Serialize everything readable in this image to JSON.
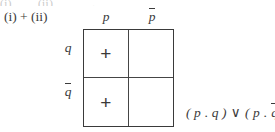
{
  "figure": {
    "case_label": "(i) + (ii)",
    "top_remnant": "(i)        (ii)            .              ,",
    "ink_color": "#3a3a3a",
    "background_color": "#ffffff"
  },
  "grid": {
    "columns": [
      {
        "label_base": "p",
        "overbar": false,
        "icon": "variable-p"
      },
      {
        "label_base": "p",
        "overbar": true,
        "icon": "variable-p-negated"
      }
    ],
    "rows": [
      {
        "label_base": "q",
        "overbar": false,
        "icon": "variable-q"
      },
      {
        "label_base": "q",
        "overbar": true,
        "icon": "variable-q-negated"
      }
    ],
    "cells": [
      [
        {
          "mark": "+",
          "filled": true
        },
        {
          "mark": "",
          "filled": false
        }
      ],
      [
        {
          "mark": "+",
          "filled": true
        },
        {
          "mark": "",
          "filled": false
        }
      ]
    ]
  },
  "result": {
    "expression": "(p.q) ∨ (p.q̄)",
    "left_open": "(",
    "left_first": "p",
    "dot": ".",
    "left_second": "q",
    "left_close": ")",
    "operator": "∨",
    "right_open": "(",
    "right_first": "p",
    "right_second": "q",
    "right_close": ")"
  }
}
